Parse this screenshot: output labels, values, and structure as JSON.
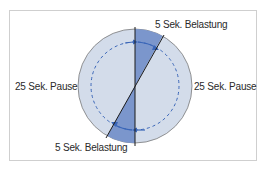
{
  "diagram": {
    "labels": {
      "top_right": "5 Sek. Belastung",
      "bottom": "5 Sek. Belastung",
      "left": "25 Sek. Pause",
      "right": "25 Sek. Pause"
    },
    "colors": {
      "circle_fill": "#d3dcea",
      "load_sector_fill": "#7b96cc",
      "circle_stroke": "#7a7a7a",
      "arrow": "#3a66b8",
      "divider_line": "#1a1a1a"
    },
    "segments": [
      {
        "name": "load",
        "duration_s": 5
      },
      {
        "name": "pause",
        "duration_s": 25
      },
      {
        "name": "load",
        "duration_s": 5
      },
      {
        "name": "pause",
        "duration_s": 25
      }
    ]
  }
}
